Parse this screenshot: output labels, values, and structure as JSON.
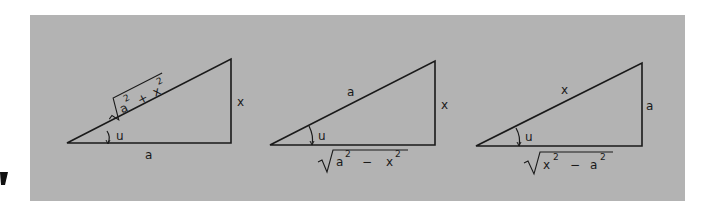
{
  "figure": {
    "panel_color": "#b3b3b3",
    "line_color": "#1a1a1a",
    "angle_label": "u",
    "triangles": [
      {
        "hypotenuse": {
          "radical": true,
          "a": "a",
          "op": "+",
          "b": "x",
          "exp": "2"
        },
        "opposite": "x",
        "adjacent": "a"
      },
      {
        "hypotenuse": "a",
        "opposite": "x",
        "adjacent": {
          "radical": true,
          "a": "a",
          "op": "−",
          "b": "x",
          "exp": "2"
        }
      },
      {
        "hypotenuse": "x",
        "opposite": "a",
        "adjacent": {
          "radical": true,
          "a": "x",
          "op": "−",
          "b": "a",
          "exp": "2"
        }
      }
    ]
  },
  "labels": {
    "t1_hyp_a": "a",
    "t1_hyp_op": "+",
    "t1_hyp_b": "x",
    "t1_exp": "2",
    "t1_opp": "x",
    "t1_adj": "a",
    "t1_angle": "u",
    "t2_hyp": "a",
    "t2_opp": "x",
    "t2_adj_a": "a",
    "t2_adj_op": "−",
    "t2_adj_b": "x",
    "t2_exp": "2",
    "t2_angle": "u",
    "t3_hyp": "x",
    "t3_opp": "a",
    "t3_adj_a": "x",
    "t3_adj_op": "−",
    "t3_adj_b": "a",
    "t3_exp": "2",
    "t3_angle": "u"
  }
}
